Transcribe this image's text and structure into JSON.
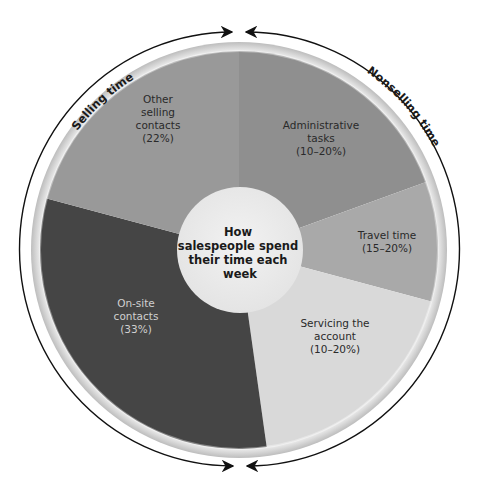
{
  "chart_data": {
    "type": "pie",
    "title": "How salespeople spend their time each week",
    "center_label_lines": [
      "How",
      "salespeople spend",
      "their time each",
      "week"
    ],
    "groups": [
      {
        "name": "Selling time",
        "segments": [
          "On-site contacts",
          "Other selling contacts"
        ]
      },
      {
        "name": "Nonselling time",
        "segments": [
          "Administrative tasks",
          "Travel time",
          "Servicing the account"
        ]
      }
    ],
    "segments": [
      {
        "name": "Administrative tasks",
        "value_label": "(10–20%)",
        "value_range": [
          10,
          20
        ],
        "start_deg": 0,
        "end_deg": 70,
        "color": "#8f8f8f",
        "text_color": "#2a2a2a",
        "label_lines": [
          "Administrative",
          "tasks",
          "(10–20%)"
        ],
        "label_pos": [
          321,
          142
        ]
      },
      {
        "name": "Travel time",
        "value_label": "(15–20%)",
        "value_range": [
          15,
          20
        ],
        "start_deg": 70,
        "end_deg": 105,
        "color": "#a9a9a9",
        "text_color": "#2a2a2a",
        "label_lines": [
          "Travel time",
          "(15–20%)"
        ],
        "label_pos": [
          387,
          245
        ]
      },
      {
        "name": "Servicing the account",
        "value_label": "(10–20%)",
        "value_range": [
          10,
          20
        ],
        "start_deg": 105,
        "end_deg": 172,
        "color": "#d9d9d9",
        "text_color": "#2a2a2a",
        "label_lines": [
          "Servicing the",
          "account",
          "(10–20%)"
        ],
        "label_pos": [
          335,
          340
        ]
      },
      {
        "name": "On-site contacts",
        "value_label": "(33%)",
        "value": 33,
        "start_deg": 172,
        "end_deg": 285,
        "color": "#454545",
        "text_color": "#d0d0d0",
        "label_lines": [
          "On-site",
          "contacts",
          "(33%)"
        ],
        "label_pos": [
          136,
          320
        ]
      },
      {
        "name": "Other selling contacts",
        "value_label": "(22%)",
        "value": 22,
        "start_deg": 285,
        "end_deg": 360,
        "color": "#999999",
        "text_color": "#2a2a2a",
        "label_lines": [
          "Other",
          "selling",
          "contacts",
          "(22%)"
        ],
        "label_pos": [
          158,
          122
        ]
      }
    ],
    "arc_labels": [
      "Selling time",
      "Nonselling time"
    ]
  }
}
